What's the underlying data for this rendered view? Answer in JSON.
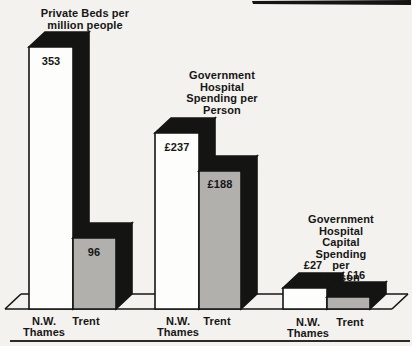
{
  "page": {
    "background_color": "#f4f2ee",
    "ink_color": "#161616",
    "has_bottom_rule": true,
    "scan_streak_note": "dark scan artifact line at top-right edge"
  },
  "chart_data": {
    "type": "bar",
    "style": "3d-extruded-bars-with-solid-black-shadow",
    "legend_position": "none",
    "grid": false,
    "series": [
      {
        "name": "N.W. Thames",
        "color": "#fdfdfb"
      },
      {
        "name": "Trent",
        "color": "#b1b0ad"
      }
    ],
    "groups": [
      {
        "title": "Private Beds per\nmillion people",
        "categories": [
          "N.W. Thames",
          "Trent"
        ],
        "values": [
          353,
          96
        ],
        "value_labels": [
          "353",
          "96"
        ],
        "unit": "beds per million people",
        "value_label_position": "inside-top"
      },
      {
        "title": "Government\nHospital\nSpending per\nPerson",
        "categories": [
          "N.W. Thames",
          "Trent"
        ],
        "values": [
          237,
          188
        ],
        "value_labels": [
          "£237",
          "£188"
        ],
        "unit": "£ per person",
        "value_label_position": "inside-top"
      },
      {
        "title": "Government\nHospital Capital\nSpending per\nPerson",
        "categories": [
          "N.W. Thames",
          "Trent"
        ],
        "values": [
          27,
          16
        ],
        "value_labels": [
          "£27",
          "£16"
        ],
        "unit": "£ per person",
        "value_label_position": "above-bar"
      }
    ],
    "layout": {
      "width": 412,
      "height": 346,
      "baseline_y": 309,
      "backline_y": 294,
      "depth_dx": 16,
      "depth_dy": -15,
      "floor_front_x": [
        5,
        392
      ],
      "floor_back_x": [
        21,
        408
      ],
      "shadow_color": "#141413",
      "outline_width": 1.6,
      "bars": [
        {
          "group": 0,
          "series": 0,
          "x": 29,
          "w": 44,
          "top": 47
        },
        {
          "group": 0,
          "series": 1,
          "x": 73,
          "w": 43,
          "top": 238
        },
        {
          "group": 1,
          "series": 0,
          "x": 155,
          "w": 44,
          "top": 133
        },
        {
          "group": 1,
          "series": 1,
          "x": 199,
          "w": 42,
          "top": 171
        },
        {
          "group": 2,
          "series": 0,
          "x": 283,
          "w": 44,
          "top": 288
        },
        {
          "group": 2,
          "series": 1,
          "x": 327,
          "w": 43,
          "top": 297
        }
      ],
      "scan_streak": [
        [
          252,
          1
        ],
        [
          411,
          0
        ],
        [
          411,
          5
        ],
        [
          253,
          4
        ]
      ]
    }
  }
}
